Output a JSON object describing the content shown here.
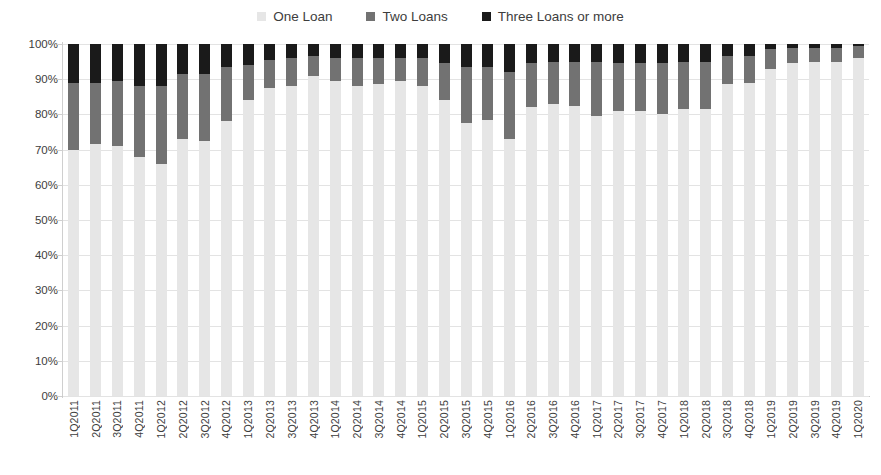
{
  "chart_data": {
    "type": "bar",
    "stacked": true,
    "stack_mode": "percent",
    "title": "",
    "subtitle": "",
    "xlabel": "",
    "ylabel": "",
    "ylim": [
      0,
      100
    ],
    "ytick_labels": [
      "0%",
      "10%",
      "20%",
      "30%",
      "40%",
      "50%",
      "60%",
      "70%",
      "80%",
      "90%",
      "100%"
    ],
    "ytick_values": [
      0,
      10,
      20,
      30,
      40,
      50,
      60,
      70,
      80,
      90,
      100
    ],
    "grid": true,
    "grid_axis": "y",
    "legend_position": "top-center",
    "legend": [
      "One Loan",
      "Two Loans",
      "Three Loans or more"
    ],
    "colors": {
      "one_loan": "#e6e6e6",
      "two_loans": "#727272",
      "three_loans_or_more": "#1a1a1a",
      "gridline": "#e3e3e3",
      "axis": "#c9c9c9",
      "text": "#3d3d3d",
      "background": "#ffffff"
    },
    "categories": [
      "1Q2011",
      "2Q2011",
      "3Q2011",
      "4Q2011",
      "1Q2012",
      "2Q2012",
      "3Q2012",
      "4Q2012",
      "1Q2013",
      "2Q2013",
      "3Q2013",
      "4Q2013",
      "1Q2014",
      "2Q2014",
      "3Q2014",
      "4Q2014",
      "1Q2015",
      "2Q2015",
      "3Q2015",
      "4Q2015",
      "1Q2016",
      "2Q2016",
      "3Q2016",
      "4Q2016",
      "1Q2017",
      "2Q2017",
      "3Q2017",
      "4Q2017",
      "1Q2018",
      "2Q2018",
      "3Q2018",
      "4Q2018",
      "1Q2019",
      "2Q2019",
      "3Q2019",
      "4Q2019",
      "1Q2020"
    ],
    "series": [
      {
        "name": "One Loan",
        "values": [
          70.0,
          71.5,
          71.0,
          68.0,
          66.0,
          73.0,
          72.5,
          78.0,
          84.0,
          87.5,
          88.0,
          91.0,
          89.5,
          88.0,
          88.5,
          89.5,
          88.0,
          84.0,
          77.5,
          78.5,
          73.0,
          82.0,
          83.0,
          82.5,
          79.5,
          81.0,
          81.0,
          80.0,
          81.5,
          81.5,
          88.5,
          89.0,
          93.0,
          94.5,
          95.0,
          95.0,
          96.0
        ]
      },
      {
        "name": "Two Loans",
        "values": [
          19.0,
          17.5,
          18.5,
          20.0,
          22.0,
          18.5,
          19.0,
          15.5,
          10.0,
          8.0,
          8.0,
          5.5,
          6.5,
          8.0,
          7.5,
          6.5,
          8.0,
          10.5,
          16.0,
          15.0,
          19.0,
          12.5,
          12.0,
          12.5,
          15.5,
          13.5,
          13.5,
          14.5,
          13.5,
          13.5,
          8.0,
          7.5,
          5.5,
          4.5,
          4.0,
          4.0,
          3.5
        ]
      },
      {
        "name": "Three Loans or more",
        "values": [
          11.0,
          11.0,
          10.5,
          12.0,
          12.0,
          8.5,
          8.5,
          6.5,
          6.0,
          4.5,
          4.0,
          3.5,
          4.0,
          4.0,
          4.0,
          4.0,
          4.0,
          5.5,
          6.5,
          6.5,
          8.0,
          5.5,
          5.0,
          5.0,
          5.0,
          5.5,
          5.5,
          5.5,
          5.0,
          5.0,
          3.5,
          3.5,
          1.5,
          1.0,
          1.0,
          1.0,
          0.5
        ]
      }
    ]
  }
}
